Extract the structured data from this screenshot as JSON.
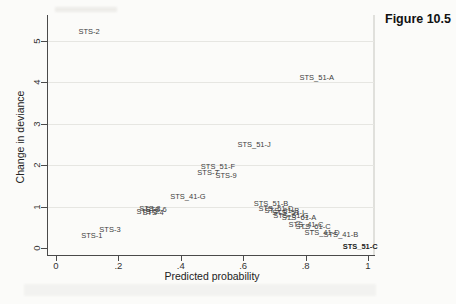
{
  "figure_label": "Figure 10.5",
  "chart_data": {
    "type": "scatter",
    "title": "",
    "xlabel": "Predicted probability",
    "ylabel": "Change in deviance",
    "xlim": [
      0,
      1
    ],
    "ylim": [
      0,
      5
    ],
    "grid": "horizontal-light",
    "legend": "none",
    "marker": "text-label-only",
    "x_ticks": [
      {
        "v": 0,
        "label": "0"
      },
      {
        "v": 0.2,
        "label": ".2"
      },
      {
        "v": 0.4,
        "label": ".4"
      },
      {
        "v": 0.6,
        "label": ".6"
      },
      {
        "v": 0.8,
        "label": ".8"
      },
      {
        "v": 1,
        "label": "1"
      }
    ],
    "y_ticks": [
      {
        "v": 0,
        "label": "0"
      },
      {
        "v": 1,
        "label": "1"
      },
      {
        "v": 2,
        "label": "2"
      },
      {
        "v": 3,
        "label": "3"
      },
      {
        "v": 4,
        "label": "4"
      },
      {
        "v": 5,
        "label": "5"
      }
    ],
    "points": [
      {
        "label": "STS-2",
        "x": 0.106,
        "y": 5.24,
        "bold": false
      },
      {
        "label": "STS_51-A",
        "x": 0.836,
        "y": 4.13,
        "bold": false
      },
      {
        "label": "STS_51-J",
        "x": 0.635,
        "y": 2.51,
        "bold": false
      },
      {
        "label": "STS_51-F",
        "x": 0.519,
        "y": 1.98,
        "bold": false
      },
      {
        "label": "STS-7",
        "x": 0.487,
        "y": 1.83,
        "bold": false
      },
      {
        "label": "STS-9",
        "x": 0.545,
        "y": 1.76,
        "bold": false
      },
      {
        "label": "STS_41-G",
        "x": 0.423,
        "y": 1.26,
        "bold": false
      },
      {
        "label": "STS-8",
        "x": 0.301,
        "y": 0.965,
        "bold": false
      },
      {
        "label": "STS-6",
        "x": 0.321,
        "y": 0.94,
        "bold": false
      },
      {
        "label": "STS-5",
        "x": 0.292,
        "y": 0.89,
        "bold": false
      },
      {
        "label": "STS-4",
        "x": 0.311,
        "y": 0.865,
        "bold": false
      },
      {
        "label": "STS-3",
        "x": 0.173,
        "y": 0.46,
        "bold": false
      },
      {
        "label": "STS-1",
        "x": 0.115,
        "y": 0.31,
        "bold": false
      },
      {
        "label": "STS_51-B",
        "x": 0.689,
        "y": 1.09,
        "bold": false
      },
      {
        "label": "STS_51-D",
        "x": 0.705,
        "y": 0.965,
        "bold": false
      },
      {
        "label": "STS_61-B",
        "x": 0.724,
        "y": 0.92,
        "bold": false
      },
      {
        "label": "STS_51-I",
        "x": 0.744,
        "y": 0.87,
        "bold": false
      },
      {
        "label": "STS_51-G",
        "x": 0.753,
        "y": 0.795,
        "bold": false
      },
      {
        "label": "STS_61-A",
        "x": 0.779,
        "y": 0.75,
        "bold": false
      },
      {
        "label": "STS_41-C",
        "x": 0.801,
        "y": 0.58,
        "bold": false
      },
      {
        "label": "STS_61-C",
        "x": 0.824,
        "y": 0.53,
        "bold": false
      },
      {
        "label": "STS_41-D",
        "x": 0.853,
        "y": 0.385,
        "bold": false
      },
      {
        "label": "STS_41-B",
        "x": 0.913,
        "y": 0.335,
        "bold": false
      },
      {
        "label": "STS_51-C",
        "x": 0.975,
        "y": 0.06,
        "bold": true
      }
    ]
  }
}
